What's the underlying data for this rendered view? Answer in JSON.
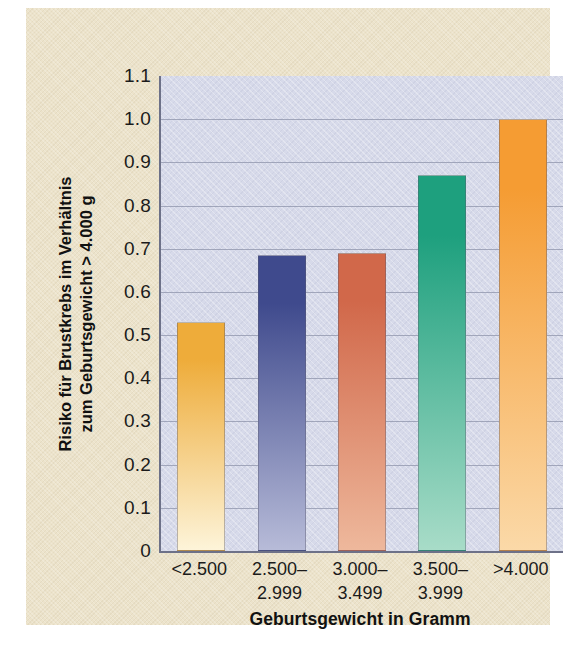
{
  "chart_data": {
    "type": "bar",
    "title": "",
    "xlabel": "Geburtsgewicht in Gramm",
    "ylabel_line1": "Risiko für Brustkrebs im Verhältnis",
    "ylabel_line2": "zum Geburtsgewicht > 4.000 g",
    "categories": [
      "<2.500",
      "2.500–2.999",
      "3.000–3.499",
      "3.500–3.999",
      ">4.000"
    ],
    "category_lines": [
      {
        "line1": "<2.500",
        "line2": ""
      },
      {
        "line1": "2.500–",
        "line2": "2.999"
      },
      {
        "line1": "3.000–",
        "line2": "3.499"
      },
      {
        "line1": "3.500–",
        "line2": "3.999"
      },
      {
        "line1": ">4.000",
        "line2": ""
      }
    ],
    "values": [
      0.53,
      0.685,
      0.69,
      0.87,
      1.0
    ],
    "ylim": [
      0,
      1.1
    ],
    "yticks": [
      "0",
      "0.1",
      "0.2",
      "0.3",
      "0.4",
      "0.5",
      "0.6",
      "0.7",
      "0.8",
      "0.9",
      "1.0",
      "1.1"
    ],
    "ytick_values": [
      0,
      0.1,
      0.2,
      0.3,
      0.4,
      0.5,
      0.6,
      0.7,
      0.8,
      0.9,
      1.0,
      1.1
    ],
    "grid": true,
    "grid_axis": "y",
    "legend": "none",
    "bar_colors_top": [
      "#eeac3a",
      "#3f4a8d",
      "#d1684a",
      "#1ea07e",
      "#f59c33"
    ],
    "bar_colors_bottom": [
      "#fdf4d9",
      "#b7bbd8",
      "#eeb89c",
      "#a8dcc8",
      "#fbd9a8"
    ],
    "plot_background": "#d7daea",
    "paper_background": "#ece3cb",
    "axis_color": "#6d7188",
    "gridline_color": "#8b90a8"
  }
}
